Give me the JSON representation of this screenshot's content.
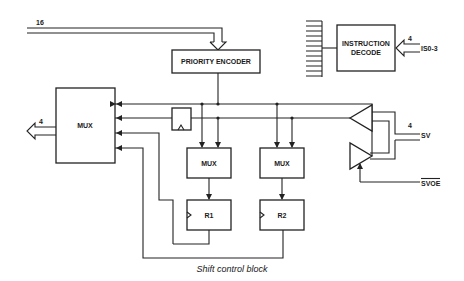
{
  "caption": "Shift control block",
  "blocks": {
    "priority_encoder": "PRIORITY ENCODER",
    "instruction_decode_line1": "INSTRUCTION",
    "instruction_decode_line2": "DECODE",
    "main_mux": "MUX",
    "mux1": "MUX",
    "mux2": "MUX",
    "reg1": "R1",
    "reg2": "R2"
  },
  "signals": {
    "input_bus_width": "16",
    "instruction_input_width": "4",
    "instruction_input": "IS0-3",
    "output_width": "4",
    "sv_width": "4",
    "sv": "SV",
    "svoe": "SVOE"
  },
  "colors": {
    "line": "#222222",
    "background": "#ffffff"
  }
}
